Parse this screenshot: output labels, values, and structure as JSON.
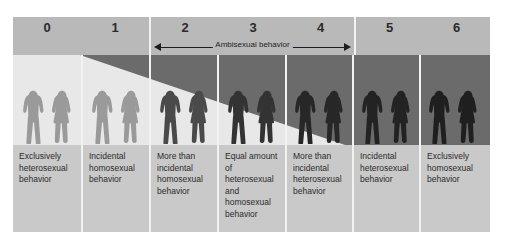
{
  "diagram": {
    "scale_range": [
      0,
      6
    ],
    "colors": {
      "header_band": "#b9b9b9",
      "caption_band": "#c9c9c9",
      "divider": "#f2f2f2",
      "figure_band_dark": "#6b6b6b",
      "figure_band_light": "#e8e8e8",
      "text": "#2b2b2b",
      "silhouette_light": "#9a9a9a",
      "silhouette_dark": "#232323"
    },
    "ambisexual": {
      "label": "Ambisexual behavior",
      "spans_columns": [
        2,
        3,
        4
      ],
      "arrow_left": "left-arrowhead",
      "arrow_right": "right-arrowhead"
    },
    "header_groups": [
      {
        "name": "group-0-1",
        "columns": [
          "0",
          "1"
        ]
      },
      {
        "name": "group-2-4",
        "columns": [
          "2",
          "3",
          "4"
        ]
      },
      {
        "name": "group-5-6",
        "columns": [
          "5",
          "6"
        ]
      }
    ],
    "columns": [
      {
        "number": "0",
        "caption": "Exclusively heterosexual behavior",
        "silhouette_shade": "light",
        "figures": [
          "male-silhouette",
          "female-silhouette"
        ]
      },
      {
        "number": "1",
        "caption": "Incidental homosexual behavior",
        "silhouette_shade": "light",
        "figures": [
          "male-silhouette",
          "female-silhouette"
        ]
      },
      {
        "number": "2",
        "caption": "More than incidental homosexual behavior",
        "silhouette_shade": "mixed",
        "figures": [
          "male-silhouette",
          "female-silhouette"
        ]
      },
      {
        "number": "3",
        "caption": "Equal amount of heterosexual and homosexual behavior",
        "silhouette_shade": "mixed",
        "figures": [
          "male-silhouette",
          "female-silhouette"
        ]
      },
      {
        "number": "4",
        "caption": "More than incidental heterosexual behavior",
        "silhouette_shade": "mixed",
        "figures": [
          "male-silhouette",
          "female-silhouette"
        ]
      },
      {
        "number": "5",
        "caption": "Incidental heterosexual behavior",
        "silhouette_shade": "dark",
        "figures": [
          "male-silhouette",
          "female-silhouette"
        ]
      },
      {
        "number": "6",
        "caption": "Exclusively homosexual behavior",
        "silhouette_shade": "dark",
        "figures": [
          "male-silhouette",
          "female-silhouette"
        ]
      }
    ]
  }
}
